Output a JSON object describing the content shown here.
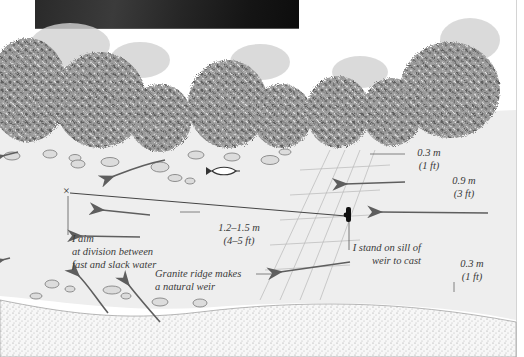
{
  "figure": {
    "photo": {
      "description": "dark photograph of river water",
      "tone": "#1c1c1c"
    },
    "colors": {
      "ink": "#3a3a3a",
      "arrow": "#5e5e5e",
      "tree_dark": "#6b6b6b",
      "tree_mist": "#c9c9c9",
      "water": "#eeeeee",
      "bank_stipple": "#9a9a9a",
      "angler": "#111111"
    },
    "labels": {
      "depth_top_m": "0.3 m",
      "depth_top_ft": "(1 ft)",
      "depth_mid_m": "0.9 m",
      "depth_mid_ft": "(3 ft)",
      "depth_pool_m": "1.2–1.5 m",
      "depth_pool_ft": "(4–5 ft)",
      "aim_line1": "I aim",
      "aim_line2": "at division between",
      "aim_line3": "fast and slack water",
      "stand_line1": "I stand on sill of",
      "stand_line2": "weir to cast",
      "ridge_line1": "Granite ridge makes",
      "ridge_line2": "a natural weir",
      "depth_low_m": "0.3 m",
      "depth_low_ft": "(1 ft)"
    },
    "markers": {
      "target": "×",
      "fish": "fish-icon",
      "angler": "angler-figure"
    }
  }
}
